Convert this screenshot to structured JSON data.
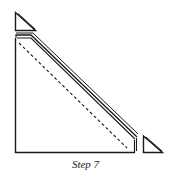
{
  "figure": {
    "caption": "Step 7",
    "stroke_color": "#1a1a1a",
    "background": "#ffffff",
    "parts": [
      {
        "name": "small-triangle-top-left",
        "points": [
          [
            15,
            12
          ],
          [
            15,
            30
          ],
          [
            35,
            30
          ]
        ]
      },
      {
        "name": "large-right-triangle",
        "points": [
          [
            15,
            38
          ],
          [
            15,
            152
          ],
          [
            135,
            152
          ],
          [
            135,
            138
          ]
        ]
      },
      {
        "name": "hypotenuse-double-edge",
        "from": [
          17,
          34
        ],
        "to": [
          137,
          136
        ]
      },
      {
        "name": "fold-dashed-line",
        "from": [
          19,
          43
        ],
        "to": [
          127,
          148
        ]
      },
      {
        "name": "small-triangle-bottom-right",
        "points": [
          [
            143,
            136
          ],
          [
            143,
            152
          ],
          [
            162,
            152
          ]
        ]
      }
    ]
  }
}
